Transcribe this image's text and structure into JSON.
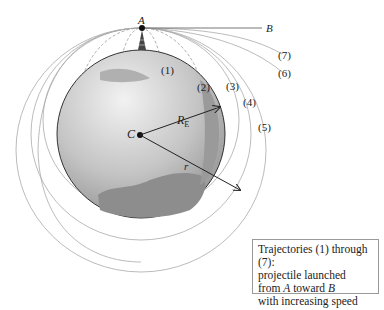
{
  "figure": {
    "points": {
      "A": "A",
      "B": "B",
      "C": "C"
    },
    "radius_labels": {
      "earth": "R",
      "earth_sub": "E",
      "orbit": "r"
    },
    "trajectories": [
      {
        "id": 1,
        "label": "(1)"
      },
      {
        "id": 2,
        "label": "(2)"
      },
      {
        "id": 3,
        "label": "(3)"
      },
      {
        "id": 4,
        "label": "(4)"
      },
      {
        "id": 5,
        "label": "(5)"
      },
      {
        "id": 6,
        "label": "(6)"
      },
      {
        "id": 7,
        "label": "(7)"
      }
    ],
    "caption": {
      "line1": "Trajectories (1) through (7):",
      "line2": "projectile launched",
      "line3_pre": "from ",
      "line3_a": "A",
      "line3_mid": " toward ",
      "line3_b": "B",
      "line4": "with increasing speed"
    },
    "colors": {
      "ocean": "#8a8a8a",
      "land": "#c8c8c8",
      "lines": "#999999"
    }
  }
}
